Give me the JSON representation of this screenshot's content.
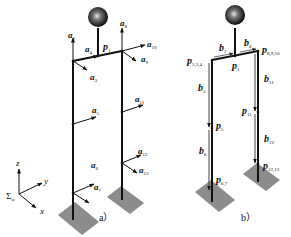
{
  "figure_a": {
    "caption": "a）",
    "labels": {
      "a2": {
        "base": "a",
        "sub": "2"
      },
      "a3": {
        "base": "a",
        "sub": "3"
      },
      "a4": {
        "base": "a",
        "sub": "4"
      },
      "a5": {
        "base": "a",
        "sub": "5"
      },
      "a6": {
        "base": "a",
        "sub": "6"
      },
      "a7": {
        "base": "a",
        "sub": "7"
      },
      "a8": {
        "base": "a",
        "sub": "8"
      },
      "a9": {
        "base": "a",
        "sub": "9"
      },
      "a10": {
        "base": "a",
        "sub": "10"
      },
      "a11": {
        "base": "a",
        "sub": "11"
      },
      "a12": {
        "base": "a",
        "sub": "12"
      },
      "a13": {
        "base": "a",
        "sub": "13"
      },
      "p1": {
        "base": "p",
        "sub": "1"
      }
    }
  },
  "figure_b": {
    "caption": "b）",
    "labels": {
      "b2": {
        "base": "b",
        "sub": "2"
      },
      "b5": {
        "base": "b",
        "sub": "5"
      },
      "b6": {
        "base": "b",
        "sub": "6"
      },
      "b8": {
        "base": "b",
        "sub": "8"
      },
      "b11": {
        "base": "b",
        "sub": "11"
      },
      "b12": {
        "base": "b",
        "sub": "12"
      },
      "p1": {
        "base": "p",
        "sub": "1"
      },
      "p234": {
        "base": "p",
        "sub": "2,3,4"
      },
      "p5": {
        "base": "p",
        "sub": "5"
      },
      "p67": {
        "base": "p",
        "sub": "6,7"
      },
      "p8910": {
        "base": "p",
        "sub": "8,9,10"
      },
      "p11": {
        "base": "p",
        "sub": "11"
      },
      "p1213": {
        "base": "p",
        "sub": "12,13"
      }
    }
  },
  "coordinate_frame": {
    "z": "z",
    "y": "y",
    "x": "x",
    "frame_symbol": "Σ",
    "frame_sub": "w"
  },
  "colors": {
    "link": "#111111",
    "ground": "#8c8c8c",
    "sphere_dark": "#111111",
    "sphere_light": "#cfcfcf"
  }
}
